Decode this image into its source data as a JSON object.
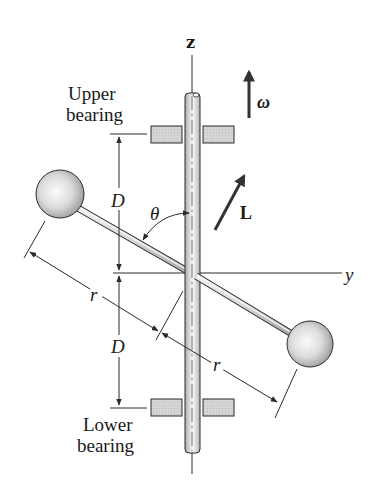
{
  "figure": {
    "axes": {
      "z_label": "z",
      "y_label": "y"
    },
    "labels": {
      "upper_bearing_line1": "Upper",
      "upper_bearing_line2": "bearing",
      "lower_bearing_line1": "Lower",
      "lower_bearing_line2": "bearing",
      "dim_upper": "D",
      "dim_lower": "D",
      "radius_left": "r",
      "radius_right": "r",
      "angle": "θ",
      "angular_velocity": "ω",
      "angular_momentum": "L"
    },
    "colors": {
      "ink": "#2a2a2a",
      "bearing_fill": "#cfcfcf",
      "shaft_fill": "#c8c8c8",
      "sphere_light": "#f6f6f6",
      "sphere_dark": "#9a9a9a"
    }
  }
}
